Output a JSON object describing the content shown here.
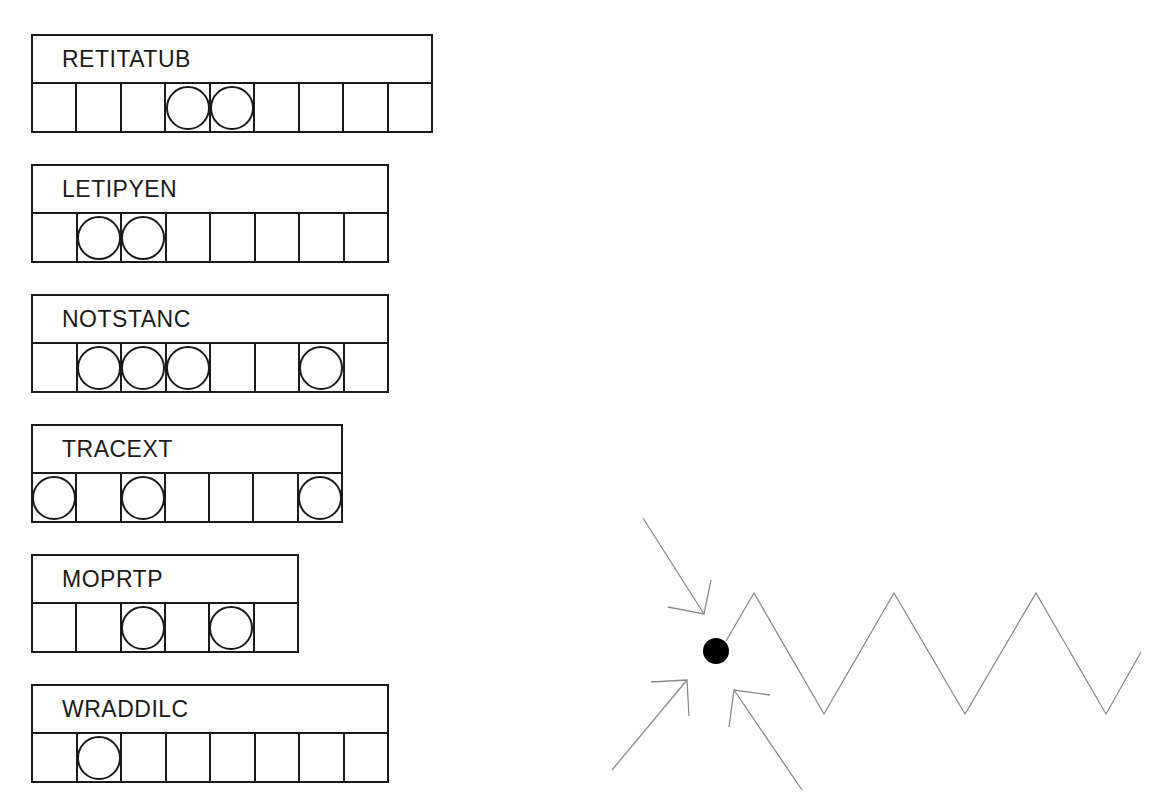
{
  "puzzle": {
    "jumbles": [
      {
        "word": "RETITATUB",
        "cells": 9,
        "circled": [
          4,
          5
        ],
        "top": 34,
        "width": 402
      },
      {
        "word": "LETIPYEN",
        "cells": 8,
        "circled": [
          2,
          3
        ],
        "top": 164,
        "width": 358
      },
      {
        "word": "NOTSTANC",
        "cells": 8,
        "circled": [
          2,
          3,
          4,
          7
        ],
        "top": 294,
        "width": 358
      },
      {
        "word": "TRACEXT",
        "cells": 7,
        "circled": [
          1,
          3,
          7
        ],
        "top": 424,
        "width": 312
      },
      {
        "word": "MOPRTP",
        "cells": 6,
        "circled": [
          3,
          5
        ],
        "top": 554,
        "width": 268
      },
      {
        "word": "WRADDILC",
        "cells": 8,
        "circled": [
          2
        ],
        "top": 684,
        "width": 358
      }
    ]
  },
  "diagram": {
    "dot": {
      "cx": 716,
      "cy": 651,
      "r": 13,
      "color": "#000000"
    },
    "zigzag": {
      "color": "#8a8a8a",
      "points": [
        [
          726,
          641
        ],
        [
          754,
          593
        ],
        [
          824,
          714
        ],
        [
          894,
          593
        ],
        [
          965,
          714
        ],
        [
          1036,
          593
        ],
        [
          1106,
          714
        ],
        [
          1141,
          652
        ]
      ]
    },
    "arrows": [
      {
        "from": [
          643,
          518
        ],
        "to": [
          704,
          614
        ],
        "head": [
          [
            668,
            607
          ],
          [
            704,
            614
          ],
          [
            711,
            580
          ]
        ]
      },
      {
        "from": [
          612,
          770
        ],
        "to": [
          687,
          680
        ],
        "head": [
          [
            651,
            682
          ],
          [
            687,
            680
          ],
          [
            689,
            716
          ]
        ]
      },
      {
        "from": [
          802,
          790
        ],
        "to": [
          734,
          690
        ],
        "head": [
          [
            729,
            727
          ],
          [
            734,
            690
          ],
          [
            770,
            695
          ]
        ]
      }
    ]
  }
}
